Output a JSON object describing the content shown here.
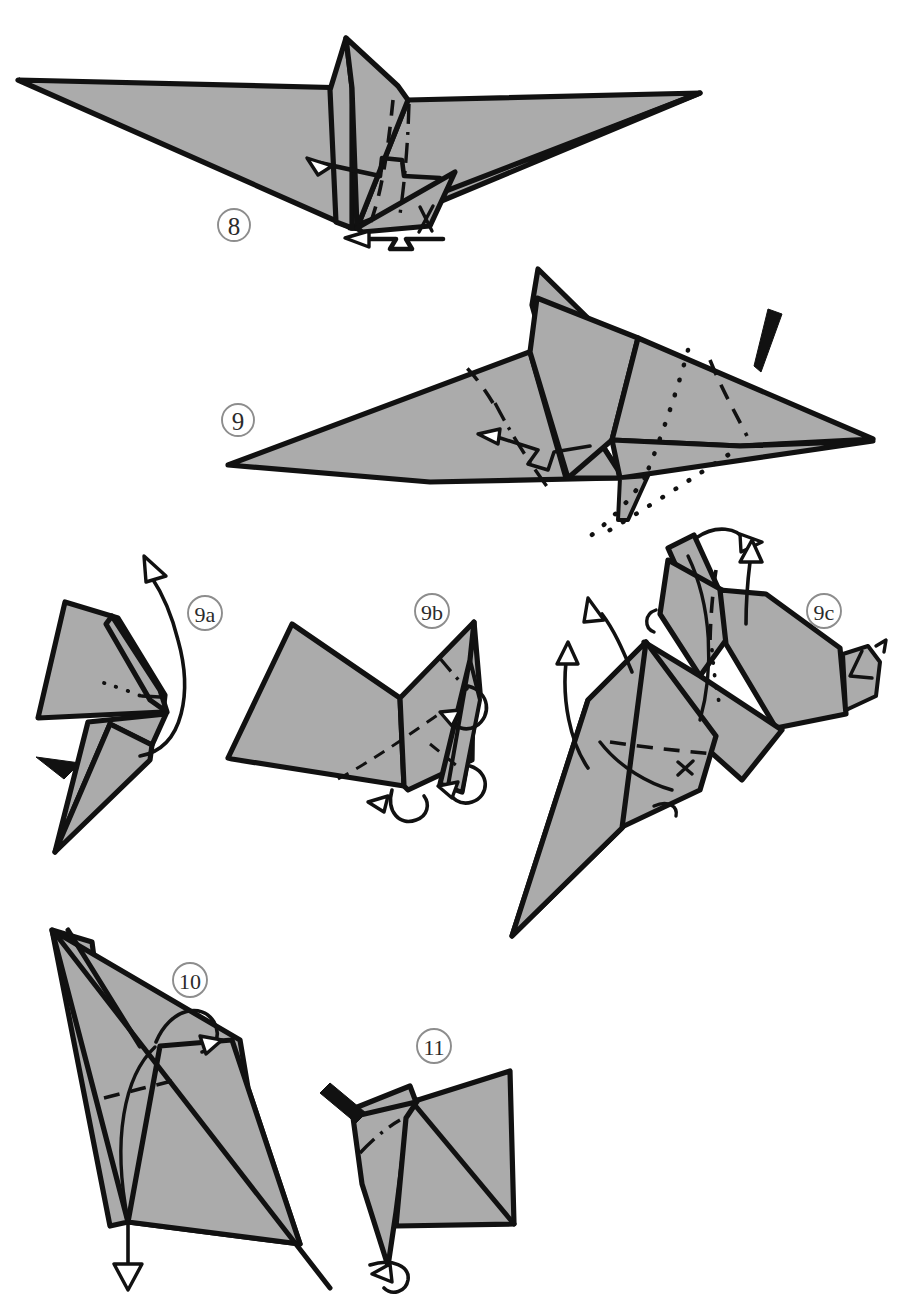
{
  "document": {
    "kind": "origami-instruction-diagram",
    "title": "Origami folding steps 8 through 11",
    "background_color": "#ffffff",
    "paper_fill_color": "#ababab",
    "ink_color": "#111111",
    "label_ring_color": "#8d8d8d",
    "width": 916,
    "height": 1299
  },
  "steps": [
    {
      "id": "step-8",
      "label": "8",
      "label_x": 234,
      "label_y": 225,
      "description": "Wide delta / manta-wing shape seen from the front with a central vertical fin. A crimp (pleat) fold is indicated at the centre by a zig-zag line with a hollow arrowhead, plus a second crimp arrow pointing left below the bottom point.",
      "annotations": [
        {
          "name": "crimp-arrow-center",
          "type": "crimp-zigzag-arrow",
          "direction": "left"
        },
        {
          "name": "crimp-arrow-bottom",
          "type": "crimp-zigzag-arrow",
          "direction": "left"
        },
        {
          "name": "valley-fold-center",
          "type": "valley-fold"
        },
        {
          "name": "mountain-fold-center",
          "type": "mountain-fold"
        }
      ]
    },
    {
      "id": "step-9",
      "label": "9",
      "label_x": 238,
      "label_y": 420,
      "description": "The model rotated so the wings lie flat to the left; a large triangular wing with the head assembly at the upper centre. A solid black push arrow at the upper right indicates an inside reverse fold; dotted lines below show the hidden edges of the flap being swung down.",
      "annotations": [
        {
          "name": "push-arrow",
          "type": "solid-black-arrow",
          "direction": "down-left"
        },
        {
          "name": "crimp-arrow",
          "type": "crimp-zigzag-arrow",
          "direction": "left"
        },
        {
          "name": "hidden-edge-lines",
          "type": "dotted-hidden-edge",
          "count": 2
        },
        {
          "name": "mountain-fold-left",
          "type": "mountain-fold"
        },
        {
          "name": "valley-fold-right",
          "type": "valley-fold"
        }
      ]
    },
    {
      "id": "step-9a",
      "label": "9a",
      "label_x": 205,
      "label_y": 613,
      "description": "Close-up detail: a narrow folded unit seen edge-on. A long curving hollow-headed arrow sweeps up and over to the right showing the flap being rotated; a small solid black arrow at the left marks where to push in.",
      "annotations": [
        {
          "name": "rotate-arrow",
          "type": "curved-hollow-arrow",
          "direction": "up-right"
        },
        {
          "name": "push-arrow",
          "type": "solid-black-arrow",
          "direction": "right"
        },
        {
          "name": "hidden-edge-lines",
          "type": "dotted-hidden-edge",
          "count": 1
        }
      ]
    },
    {
      "id": "step-9b",
      "label": "9b",
      "label_x": 432,
      "label_y": 611,
      "description": "Close-up detail: the unit opened out into a broad quadrilateral panel with a narrow spine on the right. Small looping hollow arrows at the right and bottom show the tiny flaps being tucked around.",
      "annotations": [
        {
          "name": "loop-arrow-right",
          "type": "looping-hollow-arrow"
        },
        {
          "name": "loop-arrow-bottom",
          "type": "looping-hollow-arrow"
        },
        {
          "name": "valley-fold-diagonal",
          "type": "valley-fold"
        },
        {
          "name": "mountain-fold-spine",
          "type": "mountain-fold"
        }
      ]
    },
    {
      "id": "step-9c",
      "label": "9c",
      "label_x": 824,
      "label_y": 611,
      "description": "Close-up detail: the assembled head and neck unit with a long tapering cone below. Three hollow-headed arrows at the top and left indicate flaps being swung up and out; a small beak shape projects at the right.",
      "annotations": [
        {
          "name": "swing-arrow-top-curved",
          "type": "curved-hollow-arrow",
          "direction": "right"
        },
        {
          "name": "swing-arrow-top-straight",
          "type": "straight-hollow-arrow",
          "direction": "up"
        },
        {
          "name": "swing-arrow-left-upper",
          "type": "curved-hollow-arrow",
          "direction": "up-left"
        },
        {
          "name": "swing-arrow-left-lower",
          "type": "curved-hollow-arrow",
          "direction": "up"
        },
        {
          "name": "valley-fold-body",
          "type": "valley-fold"
        },
        {
          "name": "hidden-edge-line",
          "type": "dotted-hidden-edge",
          "count": 1
        }
      ]
    },
    {
      "id": "step-10",
      "label": "10",
      "label_x": 190,
      "label_y": 980,
      "description": "A tall slanted shape (the body seen from the side). A hollow arrow at the bottom points straight down to pull the point out; a small looping hollow arrow near the top shows a flap being folded over.",
      "annotations": [
        {
          "name": "pull-down-arrow",
          "type": "straight-hollow-arrow",
          "direction": "down"
        },
        {
          "name": "loop-arrow-top",
          "type": "looping-hollow-arrow"
        },
        {
          "name": "valley-fold-horizontal",
          "type": "valley-fold"
        }
      ]
    },
    {
      "id": "step-11",
      "label": "11",
      "label_x": 434,
      "label_y": 1046,
      "description": "The result of step 10, a kite-like silhouette. A solid black push arrow at the upper left indicates an inside reverse fold of the small tip; a looping hollow arrow at the bottom point shows the tail being curled.",
      "annotations": [
        {
          "name": "push-arrow",
          "type": "solid-black-arrow",
          "direction": "down-right"
        },
        {
          "name": "loop-arrow-bottom",
          "type": "looping-hollow-arrow"
        },
        {
          "name": "mountain-fold-small",
          "type": "mountain-fold"
        }
      ]
    }
  ]
}
